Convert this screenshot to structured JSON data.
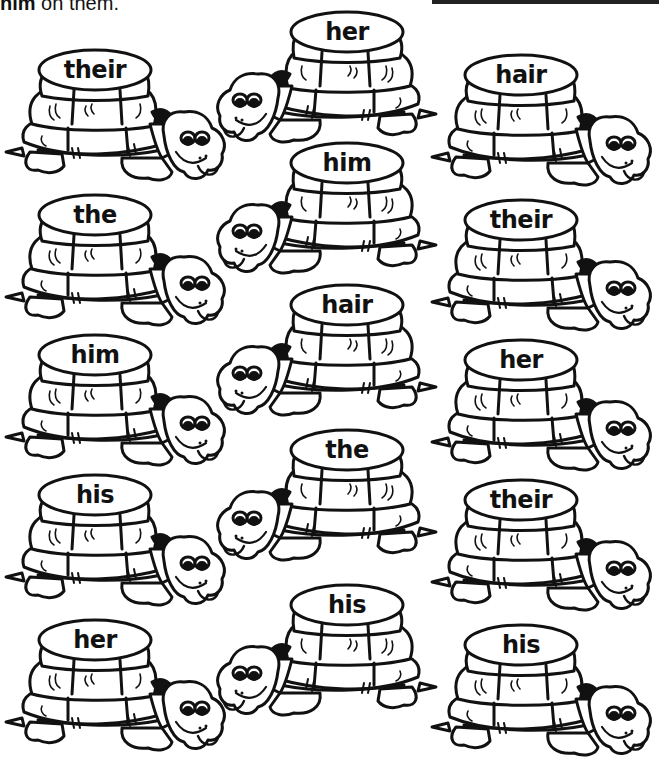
{
  "instructions": {
    "bold_word": "him",
    "rest": " on them."
  },
  "colors": {
    "ink": "#111111",
    "background": "#ffffff"
  },
  "turtles": {
    "left": [
      {
        "word": "their",
        "x": 2,
        "y": 40
      },
      {
        "word": "the",
        "x": 2,
        "y": 185
      },
      {
        "word": "him",
        "x": 2,
        "y": 325
      },
      {
        "word": "his",
        "x": 2,
        "y": 465
      },
      {
        "word": "her",
        "x": 2,
        "y": 610
      }
    ],
    "middle": [
      {
        "word": "her",
        "x": 228,
        "y": 2
      },
      {
        "word": "him",
        "x": 228,
        "y": 133
      },
      {
        "word": "hair",
        "x": 228,
        "y": 275
      },
      {
        "word": "the",
        "x": 228,
        "y": 420
      },
      {
        "word": "his",
        "x": 228,
        "y": 575
      }
    ],
    "right": [
      {
        "word": "hair",
        "x": 428,
        "y": 45
      },
      {
        "word": "their",
        "x": 428,
        "y": 190
      },
      {
        "word": "her",
        "x": 428,
        "y": 330
      },
      {
        "word": "their",
        "x": 428,
        "y": 470
      },
      {
        "word": "his",
        "x": 428,
        "y": 615
      }
    ]
  }
}
